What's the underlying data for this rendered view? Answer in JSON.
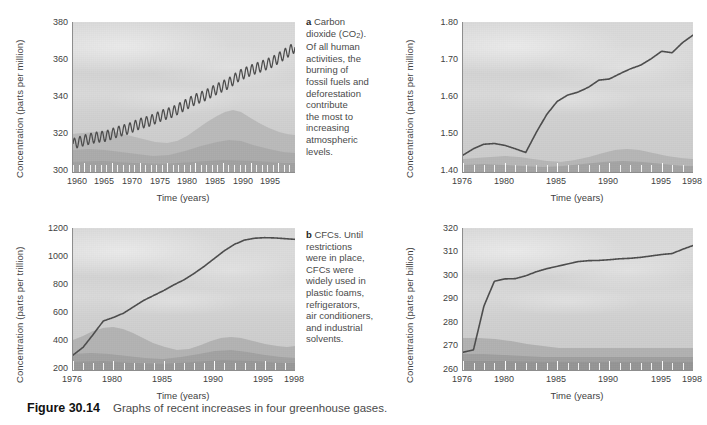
{
  "figure": {
    "label": "Figure 30.14",
    "caption": "Graphs of recent increases in four greenhouse gases."
  },
  "panels": {
    "a": {
      "key": "a",
      "caption_lead": "a",
      "caption_line1": "Carbon",
      "caption_line2_pre": "dioxide (CO",
      "caption_line2_sub": "2",
      "caption_line2_post": ").",
      "caption_rest": "Of all human activities, the burning of fossil fuels and deforestation contribute the most to increasing atmospheric levels.",
      "caption_lines": [
        "Of all human",
        "activities, the",
        "burning of",
        "fossil fuels and",
        "deforestation",
        "contribute",
        "the most to",
        "increasing",
        "atmospheric",
        "levels."
      ],
      "ylabel": "Concentration (parts per million)",
      "xlabel": "Time (years)",
      "yticks": [
        "300",
        "320",
        "340",
        "360",
        "380"
      ],
      "xticks": [
        "1960",
        "1965",
        "1970",
        "1975",
        "1980",
        "1985",
        "1990",
        "1995"
      ]
    },
    "b_top": {
      "ylabel": "Concentration (parts per million)",
      "xlabel": "Time (years)",
      "yticks": [
        "1.40",
        "1.50",
        "1.60",
        "1.70",
        "1.80"
      ],
      "xticks": [
        "1976",
        "1980",
        "1985",
        "1990",
        "1995",
        "1998"
      ]
    },
    "b": {
      "key": "b",
      "caption_lead": "b",
      "caption_line1": "CFCs. Until",
      "caption_lines": [
        "restrictions",
        "were in place,",
        "CFCs were",
        "widely used in",
        "plastic foams,",
        "refrigerators,",
        "air conditioners,",
        "and industrial",
        "solvents."
      ],
      "ylabel": "Concentration (parts per trillion)",
      "xlabel": "Time (years)",
      "yticks": [
        "200",
        "400",
        "600",
        "800",
        "1000",
        "1200"
      ],
      "xticks": [
        "1976",
        "1980",
        "1985",
        "1990",
        "1995",
        "1998"
      ]
    },
    "d": {
      "ylabel": "Concentration (parts per billion)",
      "xlabel": "Time (years)",
      "yticks": [
        "260",
        "270",
        "280",
        "290",
        "300",
        "310",
        "320"
      ],
      "xticks": [
        "1976",
        "1980",
        "1985",
        "1990",
        "1995",
        "1998"
      ]
    }
  },
  "colors": {
    "line": "#4a4a4a",
    "plot_bg": "#d6d6d6",
    "axis": "#8d8d8d",
    "text": "#3f3f3f"
  },
  "chart_data": [
    {
      "id": "co2",
      "type": "line",
      "title": "Carbon dioxide (CO2)",
      "xlabel": "Time (years)",
      "ylabel": "Concentration (parts per million)",
      "xlim": [
        1958,
        1998
      ],
      "ylim": [
        300,
        380
      ],
      "yticks": [
        300,
        320,
        340,
        360,
        380
      ],
      "xticks": [
        1960,
        1965,
        1970,
        1975,
        1980,
        1985,
        1990,
        1995
      ],
      "grid": false,
      "legend": "none",
      "note": "Keeling curve: rising trend with annual sawtooth oscillation of about 6 ppm amplitude",
      "series": [
        {
          "name": "CO2 annual mean",
          "x": [
            1958,
            1960,
            1962,
            1964,
            1966,
            1968,
            1970,
            1972,
            1974,
            1976,
            1978,
            1980,
            1982,
            1984,
            1986,
            1988,
            1990,
            1992,
            1994,
            1996,
            1998
          ],
          "values": [
            315,
            316.9,
            318.4,
            319.2,
            321.4,
            323.1,
            325.7,
            327.4,
            330.2,
            332.1,
            335.4,
            338.7,
            341.1,
            344.4,
            347.2,
            351.5,
            354.2,
            356.4,
            358.8,
            362.6,
            366.6
          ]
        }
      ]
    },
    {
      "id": "methane",
      "type": "line",
      "title": "Methane",
      "xlabel": "Time (years)",
      "ylabel": "Concentration (parts per million)",
      "xlim": [
        1976,
        1998
      ],
      "ylim": [
        1.4,
        1.8
      ],
      "yticks": [
        1.4,
        1.5,
        1.6,
        1.7,
        1.8
      ],
      "xticks": [
        1976,
        1980,
        1985,
        1990,
        1995,
        1998
      ],
      "grid": false,
      "legend": "none",
      "series": [
        {
          "name": "CH4",
          "x": [
            1976,
            1977,
            1978,
            1979,
            1980,
            1981,
            1982,
            1983,
            1984,
            1985,
            1986,
            1987,
            1988,
            1989,
            1990,
            1991,
            1992,
            1993,
            1994,
            1995,
            1996,
            1997,
            1998
          ],
          "values": [
            1.445,
            1.462,
            1.474,
            1.476,
            1.471,
            1.462,
            1.452,
            1.505,
            1.553,
            1.588,
            1.605,
            1.613,
            1.626,
            1.645,
            1.648,
            1.662,
            1.675,
            1.685,
            1.702,
            1.722,
            1.718,
            1.745,
            1.765
          ]
        }
      ]
    },
    {
      "id": "cfc",
      "type": "line",
      "title": "CFCs",
      "xlabel": "Time (years)",
      "ylabel": "Concentration (parts per trillion)",
      "xlim": [
        1976,
        1998
      ],
      "ylim": [
        200,
        1200
      ],
      "yticks": [
        200,
        400,
        600,
        800,
        1000,
        1200
      ],
      "xticks": [
        1976,
        1980,
        1985,
        1990,
        1995,
        1998
      ],
      "grid": false,
      "legend": "none",
      "series": [
        {
          "name": "CFC total",
          "x": [
            1976,
            1977,
            1978,
            1979,
            1980,
            1981,
            1982,
            1983,
            1984,
            1985,
            1986,
            1987,
            1988,
            1989,
            1990,
            1991,
            1992,
            1993,
            1994,
            1995,
            1996,
            1997,
            1998
          ],
          "values": [
            305,
            360,
            450,
            545,
            570,
            600,
            645,
            690,
            725,
            760,
            800,
            835,
            880,
            930,
            985,
            1040,
            1085,
            1115,
            1128,
            1132,
            1130,
            1125,
            1120
          ]
        }
      ]
    },
    {
      "id": "n2o",
      "type": "line",
      "title": "Nitrous oxide",
      "xlabel": "Time (years)",
      "ylabel": "Concentration (parts per billion)",
      "xlim": [
        1976,
        1998
      ],
      "ylim": [
        260,
        320
      ],
      "yticks": [
        260,
        270,
        280,
        290,
        300,
        310,
        320
      ],
      "xticks": [
        1976,
        1980,
        1985,
        1990,
        1995,
        1998
      ],
      "grid": false,
      "legend": "none",
      "series": [
        {
          "name": "N2O",
          "x": [
            1976,
            1977,
            1978,
            1979,
            1980,
            1981,
            1982,
            1983,
            1984,
            1985,
            1986,
            1987,
            1988,
            1989,
            1990,
            1991,
            1992,
            1993,
            1994,
            1995,
            1996,
            1997,
            1998
          ],
          "values": [
            267.5,
            268.5,
            287,
            297.5,
            298.5,
            298.6,
            299.8,
            301.5,
            302.8,
            303.8,
            304.8,
            305.8,
            306.2,
            306.3,
            306.6,
            307.0,
            307.2,
            307.6,
            308.2,
            308.8,
            309.2,
            311.0,
            312.6
          ]
        }
      ]
    }
  ]
}
